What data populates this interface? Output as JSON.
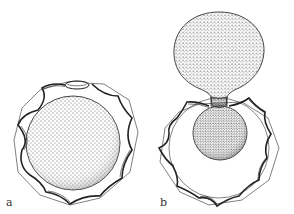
{
  "figure": {
    "panels": [
      {
        "id": "a",
        "label": "a",
        "description": "spherical body with cap inside polygonal wing frame"
      },
      {
        "id": "b",
        "label": "b",
        "description": "pear-shaped extruded body above small sphere inside polygonal wing frame"
      }
    ],
    "colors": {
      "ink": "#2a2a2a",
      "stipple": "#555555",
      "background": "#ffffff"
    }
  }
}
